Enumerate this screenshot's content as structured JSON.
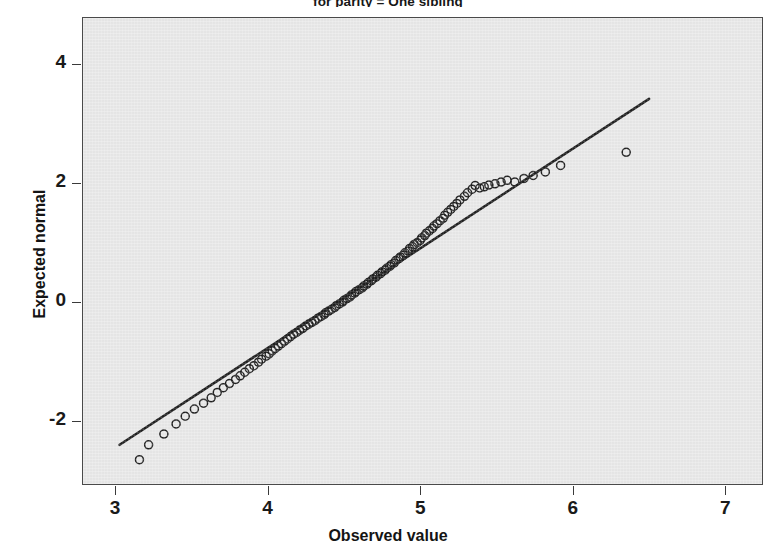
{
  "figure": {
    "title": "for parity = One sibling",
    "background_color": "#ffffff",
    "panel_color": "#e9e9e9",
    "ink_color": "#1a1a1a"
  },
  "axes": {
    "x_title": "Observed value",
    "y_title": "Expected normal",
    "x_ticks": [
      "3",
      "4",
      "5",
      "6",
      "7"
    ],
    "y_ticks": [
      "4",
      "2",
      "0",
      "-2"
    ]
  },
  "chart_data": {
    "type": "scatter",
    "title": "for parity = One sibling",
    "subtitle": "",
    "xlabel": "Observed value",
    "ylabel": "Expected normal",
    "xlim": [
      2.79,
      7.24
    ],
    "ylim": [
      -3.06,
      4.78
    ],
    "xticks": [
      3,
      4,
      5,
      6,
      7
    ],
    "yticks": [
      -2,
      0,
      2,
      4
    ],
    "grid": false,
    "legend": null,
    "marker": "open-circle",
    "marker_size_px": 8,
    "reference_line": {
      "label": "normal reference line",
      "x_start": 3.03,
      "y_start": -2.4,
      "x_end": 6.5,
      "y_end": 3.42,
      "color": "#1a1a1a",
      "width_px": 2.6
    },
    "series": [
      {
        "name": "Q-Q points",
        "x": [
          3.16,
          3.22,
          3.32,
          3.4,
          3.46,
          3.52,
          3.58,
          3.63,
          3.67,
          3.71,
          3.75,
          3.79,
          3.82,
          3.85,
          3.88,
          3.91,
          3.94,
          3.96,
          3.99,
          4.01,
          4.03,
          4.05,
          4.07,
          4.09,
          4.11,
          4.13,
          4.15,
          4.17,
          4.19,
          4.21,
          4.23,
          4.25,
          4.27,
          4.29,
          4.31,
          4.33,
          4.35,
          4.37,
          4.38,
          4.4,
          4.42,
          4.44,
          4.45,
          4.47,
          4.49,
          4.5,
          4.52,
          4.54,
          4.55,
          4.57,
          4.58,
          4.6,
          4.62,
          4.63,
          4.65,
          4.66,
          4.68,
          4.69,
          4.71,
          4.72,
          4.74,
          4.75,
          4.77,
          4.78,
          4.8,
          4.81,
          4.83,
          4.84,
          4.86,
          4.87,
          4.89,
          4.9,
          4.92,
          4.93,
          4.95,
          4.96,
          4.98,
          5.0,
          5.01,
          5.03,
          5.04,
          5.06,
          5.08,
          5.09,
          5.11,
          5.13,
          5.15,
          5.16,
          5.18,
          5.2,
          5.22,
          5.24,
          5.26,
          5.29,
          5.31,
          5.34,
          5.36,
          5.39,
          5.42,
          5.45,
          5.49,
          5.53,
          5.57,
          5.62,
          5.68,
          5.74,
          5.82,
          5.92,
          6.35
        ],
        "y": [
          -2.65,
          -2.4,
          -2.22,
          -2.05,
          -1.92,
          -1.8,
          -1.7,
          -1.61,
          -1.52,
          -1.44,
          -1.37,
          -1.3,
          -1.24,
          -1.18,
          -1.12,
          -1.07,
          -1.01,
          -0.96,
          -0.91,
          -0.87,
          -0.82,
          -0.78,
          -0.74,
          -0.7,
          -0.66,
          -0.62,
          -0.58,
          -0.54,
          -0.51,
          -0.47,
          -0.44,
          -0.4,
          -0.37,
          -0.34,
          -0.31,
          -0.27,
          -0.24,
          -0.21,
          -0.18,
          -0.15,
          -0.12,
          -0.09,
          -0.06,
          -0.03,
          0.0,
          0.03,
          0.06,
          0.09,
          0.12,
          0.15,
          0.18,
          0.21,
          0.24,
          0.27,
          0.3,
          0.33,
          0.36,
          0.39,
          0.42,
          0.45,
          0.48,
          0.51,
          0.54,
          0.57,
          0.6,
          0.63,
          0.66,
          0.7,
          0.73,
          0.76,
          0.79,
          0.83,
          0.86,
          0.9,
          0.93,
          0.97,
          1.0,
          1.04,
          1.08,
          1.12,
          1.16,
          1.2,
          1.24,
          1.28,
          1.32,
          1.37,
          1.41,
          1.46,
          1.51,
          1.56,
          1.61,
          1.66,
          1.72,
          1.78,
          1.84,
          1.9,
          1.96,
          1.92,
          1.94,
          1.97,
          1.99,
          2.02,
          2.05,
          2.02,
          2.08,
          2.13,
          2.19,
          2.3,
          2.52
        ]
      }
    ],
    "annotations": [
      {
        "text": "upper-right outlier",
        "x": 6.35,
        "y": 2.52
      },
      {
        "text": "lower-left tail below reference line",
        "x": 3.16,
        "y": -2.65
      }
    ]
  }
}
